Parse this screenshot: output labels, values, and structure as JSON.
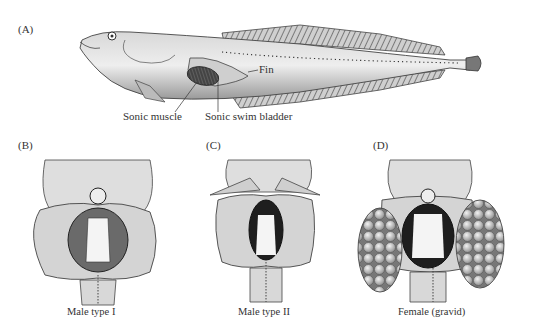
{
  "figure": {
    "panels": [
      {
        "id": "A",
        "label": "(A)",
        "subject": "whole fish lateral view"
      },
      {
        "id": "B",
        "label": "(B)",
        "caption": "Male type I"
      },
      {
        "id": "C",
        "label": "(C)",
        "caption": "Male type II"
      },
      {
        "id": "D",
        "label": "(D)",
        "caption": "Female (gravid)"
      }
    ],
    "callouts": {
      "fin": "Fin",
      "sonic_muscle": "Sonic muscle",
      "sonic_swim_bladder": "Sonic swim bladder"
    },
    "colors": {
      "background": "#ffffff",
      "ink": "#222222",
      "body_gray": "#c8c8c8",
      "dark_muscle": "#3a3a3a"
    }
  }
}
